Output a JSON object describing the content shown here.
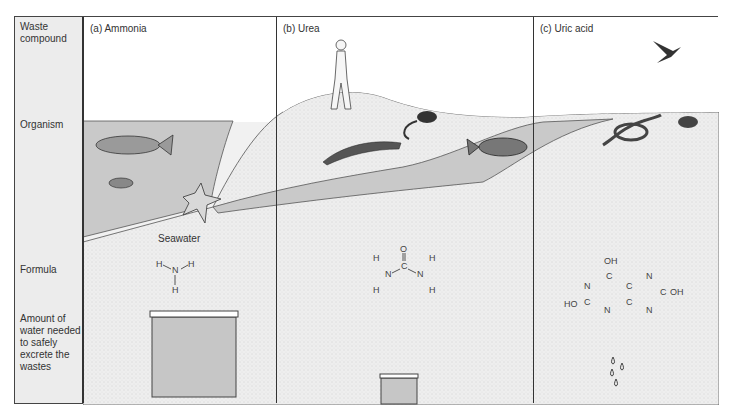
{
  "row_labels": {
    "waste_compound": "Waste compound",
    "organism": "Organism",
    "formula": "Formula",
    "water_amount": "Amount of water needed to safely excrete the wastes"
  },
  "columns": [
    {
      "title": "(a) Ammonia",
      "habitat_label": "Seawater",
      "organisms": [
        "fish",
        "small-fish",
        "starfish"
      ],
      "formula_atoms": [
        "H",
        "N",
        "H",
        "H"
      ],
      "water_amount": "large"
    },
    {
      "title": "(b) Urea",
      "organisms": [
        "human",
        "rat",
        "salamander",
        "fish"
      ],
      "formula_atoms": [
        "O",
        "C",
        "N",
        "N",
        "H",
        "H",
        "H",
        "H"
      ],
      "water_amount": "small"
    },
    {
      "title": "(c) Uric acid",
      "organisms": [
        "bird",
        "snake",
        "beetle"
      ],
      "formula_atoms": [
        "OH",
        "C",
        "N",
        "C",
        "C",
        "N",
        "C",
        "OH",
        "HO",
        "C",
        "N",
        "N"
      ],
      "water_amount": "drops"
    }
  ],
  "colors": {
    "water": "#c9c9c9",
    "land": "#e8e8e8",
    "border": "#333333",
    "background": "#f1f1f1"
  }
}
